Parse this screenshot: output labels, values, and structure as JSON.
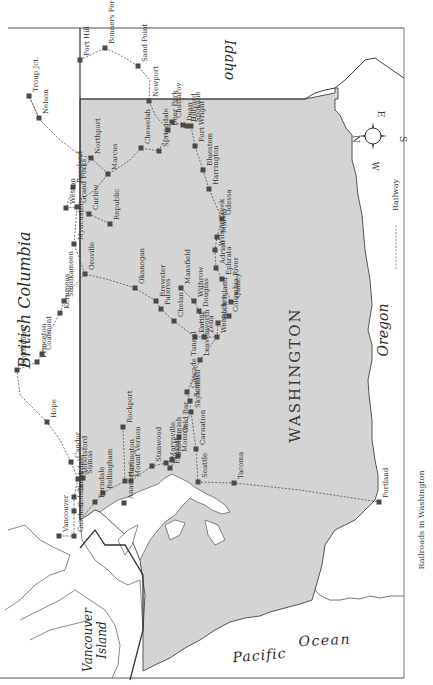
{
  "map": {
    "title": "Railroads in Washington",
    "orientation": "rotated 90° clockwise (north to left)",
    "colors": {
      "washington_fill": "#d4d4d4",
      "water": "#ffffff",
      "border": "#444444",
      "railway": "#555555",
      "station": "#4a4a4a"
    },
    "regions": {
      "british_columbia": "British Columbia",
      "idaho": "Idaho",
      "washington": "WASHINGTON",
      "oregon": "Oregon",
      "vancouver_island_1": "Vancouver",
      "vancouver_island_2": "Island",
      "pacific": "Pacific",
      "ocean": "Ocean"
    },
    "compass": {
      "n": "N",
      "e": "E",
      "s": "S",
      "w": "W"
    },
    "legend": {
      "railway": "Railway"
    },
    "caption": "Railroads in Washington",
    "stations": [
      {
        "name": "Troup Jct.",
        "x": 29,
        "y": 96
      },
      {
        "name": "Nelson",
        "x": 39,
        "y": 118
      },
      {
        "name": "Port Hill",
        "x": 80,
        "y": 60
      },
      {
        "name": "Bonners Ferry",
        "x": 105,
        "y": 48
      },
      {
        "name": "Sand Point",
        "x": 138,
        "y": 66
      },
      {
        "name": "Newport",
        "x": 149,
        "y": 101
      },
      {
        "name": "Chattaroy",
        "x": 172,
        "y": 122
      },
      {
        "name": "Dean",
        "x": 183,
        "y": 125
      },
      {
        "name": "Hillyard",
        "x": 187,
        "y": 126
      },
      {
        "name": "Spokane",
        "x": 191,
        "y": 126
      },
      {
        "name": "Deer Park",
        "x": 168,
        "y": 130
      },
      {
        "name": "Springdale",
        "x": 159,
        "y": 151
      },
      {
        "name": "Chewelah",
        "x": 141,
        "y": 148
      },
      {
        "name": "Fort Wright",
        "x": 195,
        "y": 146
      },
      {
        "name": "Bluestem",
        "x": 203,
        "y": 170
      },
      {
        "name": "Harrington",
        "x": 209,
        "y": 189
      },
      {
        "name": "Odessa",
        "x": 222,
        "y": 219
      },
      {
        "name": "Martin",
        "x": 217,
        "y": 237
      },
      {
        "name": "Wilson Creek",
        "x": 215,
        "y": 250
      },
      {
        "name": "Northport",
        "x": 91,
        "y": 158
      },
      {
        "name": "Marcus",
        "x": 108,
        "y": 174
      },
      {
        "name": "Rossland",
        "x": 73,
        "y": 187
      },
      {
        "name": "Weston",
        "x": 66,
        "y": 208
      },
      {
        "name": "Grand Forks",
        "x": 77,
        "y": 207
      },
      {
        "name": "Curlew",
        "x": 89,
        "y": 214
      },
      {
        "name": "Republic",
        "x": 110,
        "y": 224
      },
      {
        "name": "Myncaster",
        "x": 74,
        "y": 244
      },
      {
        "name": "Oroville",
        "x": 85,
        "y": 274
      },
      {
        "name": "Similkameen",
        "x": 64,
        "y": 301
      },
      {
        "name": "Keremeos",
        "x": 60,
        "y": 313
      },
      {
        "name": "Coalmont",
        "x": 42,
        "y": 354
      },
      {
        "name": "Princeton",
        "x": 37,
        "y": 362
      },
      {
        "name": "Brookmere",
        "x": 17,
        "y": 370
      },
      {
        "name": "Hope",
        "x": 47,
        "y": 422
      },
      {
        "name": "Okanogan",
        "x": 135,
        "y": 288
      },
      {
        "name": "Brewster",
        "x": 156,
        "y": 301
      },
      {
        "name": "Pateros",
        "x": 161,
        "y": 309
      },
      {
        "name": "Mansfield",
        "x": 181,
        "y": 288
      },
      {
        "name": "Withrow",
        "x": 194,
        "y": 301
      },
      {
        "name": "Douglas",
        "x": 199,
        "y": 311
      },
      {
        "name": "Adrian",
        "x": 216,
        "y": 268
      },
      {
        "name": "Ephrata",
        "x": 222,
        "y": 279
      },
      {
        "name": "Quincy",
        "x": 231,
        "y": 302
      },
      {
        "name": "Chelan",
        "x": 174,
        "y": 321
      },
      {
        "name": "Entiat",
        "x": 195,
        "y": 337
      },
      {
        "name": "Zena",
        "x": 204,
        "y": 337
      },
      {
        "name": "Wenatchee",
        "x": 217,
        "y": 337
      },
      {
        "name": "Rock Island",
        "x": 218,
        "y": 323
      },
      {
        "name": "Columbia River",
        "x": 229,
        "y": 316
      },
      {
        "name": "Leavenworth",
        "x": 200,
        "y": 360
      },
      {
        "name": "Cascade Tunnel",
        "x": 187,
        "y": 392
      },
      {
        "name": "Scenic",
        "x": 190,
        "y": 401
      },
      {
        "name": "Skykomish",
        "x": 191,
        "y": 412
      },
      {
        "name": "Gold Bar",
        "x": 179,
        "y": 437
      },
      {
        "name": "Carnation",
        "x": 196,
        "y": 449
      },
      {
        "name": "Monroe",
        "x": 178,
        "y": 456
      },
      {
        "name": "Snohomish",
        "x": 172,
        "y": 460
      },
      {
        "name": "Marysville",
        "x": 166,
        "y": 463
      },
      {
        "name": "Everett",
        "x": 170,
        "y": 468
      },
      {
        "name": "Stanwood",
        "x": 152,
        "y": 466
      },
      {
        "name": "Seattle",
        "x": 198,
        "y": 482
      },
      {
        "name": "Tacoma",
        "x": 234,
        "y": 483
      },
      {
        "name": "Rockport",
        "x": 123,
        "y": 427
      },
      {
        "name": "Mount Vernon",
        "x": 131,
        "y": 481
      },
      {
        "name": "Burlington",
        "x": 125,
        "y": 481
      },
      {
        "name": "Anacortes",
        "x": 124,
        "y": 503
      },
      {
        "name": "Bellingham",
        "x": 103,
        "y": 493
      },
      {
        "name": "Ferndale",
        "x": 95,
        "y": 502
      },
      {
        "name": "Sumas",
        "x": 83,
        "y": 478
      },
      {
        "name": "Abbotsford",
        "x": 78,
        "y": 479
      },
      {
        "name": "Candor",
        "x": 71,
        "y": 462
      },
      {
        "name": "Cloverdale",
        "x": 74,
        "y": 497
      },
      {
        "name": "Colebrook",
        "x": 74,
        "y": 511
      },
      {
        "name": "Vancouver",
        "x": 59,
        "y": 536
      },
      {
        "name": "Guichon",
        "x": 74,
        "y": 536
      },
      {
        "name": "Portland",
        "x": 379,
        "y": 502
      }
    ]
  }
}
